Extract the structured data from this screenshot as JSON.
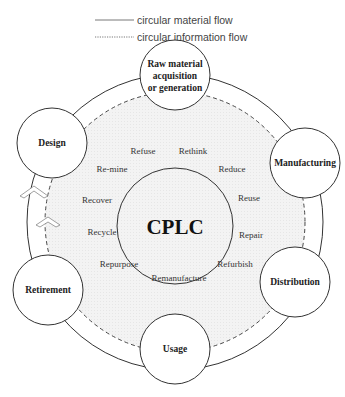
{
  "legend": {
    "items": [
      {
        "label": "circular material flow",
        "style": "solid"
      },
      {
        "label": "circular information flow",
        "style": "dotted"
      }
    ]
  },
  "center": {
    "label": "CPLC"
  },
  "lifecycle_nodes": [
    {
      "id": "raw",
      "lines": [
        "Raw material",
        "acquisition",
        "or generation"
      ]
    },
    {
      "id": "manufacturing",
      "lines": [
        "Manufacturing"
      ]
    },
    {
      "id": "distribution",
      "lines": [
        "Distribution"
      ]
    },
    {
      "id": "usage",
      "lines": [
        "Usage"
      ]
    },
    {
      "id": "retirement",
      "lines": [
        "Retirement"
      ]
    },
    {
      "id": "design",
      "lines": [
        "Design"
      ]
    }
  ],
  "r_strategies": [
    {
      "label": "Refuse"
    },
    {
      "label": "Rethink"
    },
    {
      "label": "Reduce"
    },
    {
      "label": "Reuse"
    },
    {
      "label": "Repair"
    },
    {
      "label": "Refurbish"
    },
    {
      "label": "Remanufacture"
    },
    {
      "label": "Repurpose"
    },
    {
      "label": "Recycle"
    },
    {
      "label": "Recover"
    },
    {
      "label": "Re-mine"
    }
  ],
  "colors": {
    "line": "#333333",
    "inner_fill": "#f0f0f0",
    "node_fill": "#ffffff"
  }
}
